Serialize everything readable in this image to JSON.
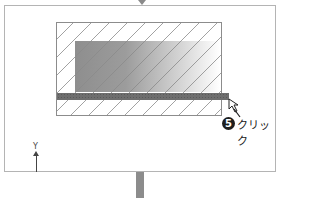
{
  "diagram": {
    "step": {
      "number": "5",
      "label": "クリック"
    },
    "axis": {
      "label": "Y"
    },
    "colors": {
      "frame_border": "#b4b4b4",
      "rect_border": "#8c8c8c",
      "bar": "#6e6e6e",
      "gradient_start": "#8e8e8e",
      "gradient_end": "#ffffff",
      "badge": "#1e1e1e"
    }
  }
}
